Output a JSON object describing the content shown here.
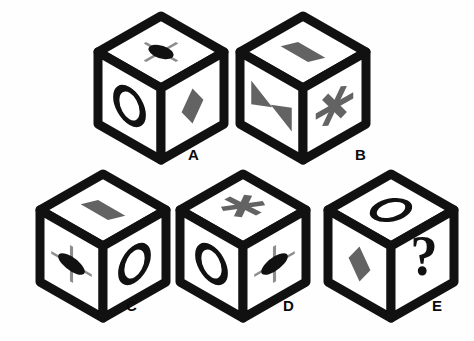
{
  "page": {
    "background_color": "#fefefe",
    "ink_color": "#111111",
    "fill_gray": "#636363",
    "cross_gray": "#8d8d8d",
    "face_color": "#ffffff",
    "width": 474,
    "height": 341
  },
  "legend": {
    "symbol_names": {
      "crossed_ellipse": "crossed-ellipse-symbol",
      "oval_ring": "oval-ring-symbol",
      "diamond": "diamond-symbol",
      "parallelogram": "parallelogram-symbol",
      "bowtie": "bowtie-symbol",
      "asterisk": "asterisk-symbol",
      "question_mark": "question-mark-symbol"
    }
  },
  "cubes": [
    {
      "id": "A",
      "label": "A",
      "x": 96,
      "y": 14,
      "label_x": 188,
      "label_y": 147,
      "faces": {
        "top": "crossed_ellipse",
        "left": "oval_ring",
        "right": "diamond"
      }
    },
    {
      "id": "B",
      "label": "B",
      "x": 238,
      "y": 14,
      "label_x": 355,
      "label_y": 147,
      "faces": {
        "top": "parallelogram",
        "left": "bowtie",
        "right": "asterisk"
      }
    },
    {
      "id": "C",
      "label": "C",
      "x": 38,
      "y": 172,
      "label_x": 126,
      "label_y": 298,
      "faces": {
        "top": "parallelogram",
        "left": "crossed_ellipse",
        "right": "oval_ring"
      }
    },
    {
      "id": "D",
      "label": "D",
      "x": 178,
      "y": 172,
      "label_x": 283,
      "label_y": 298,
      "faces": {
        "top": "asterisk",
        "left": "oval_ring",
        "right": "crossed_ellipse"
      }
    },
    {
      "id": "E",
      "label": "E",
      "x": 326,
      "y": 172,
      "label_x": 432,
      "label_y": 298,
      "faces": {
        "top": "oval_ring",
        "left": "diamond",
        "right": "question_mark"
      }
    }
  ],
  "question_mark_text": "?"
}
